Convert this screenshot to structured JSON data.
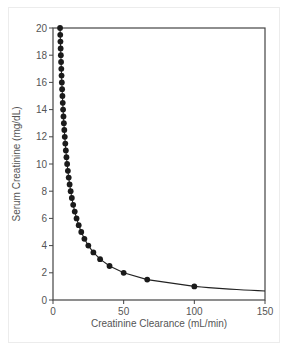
{
  "chart_data": {
    "type": "line",
    "title": "",
    "xlabel": "Creatinine Clearance (mL/min)",
    "ylabel": "Serum Creatinine (mg/dL)",
    "xlim": [
      0,
      150
    ],
    "ylim": [
      0,
      20
    ],
    "xticks": [
      0,
      50,
      100,
      150
    ],
    "yticks": [
      0,
      2,
      4,
      6,
      8,
      10,
      12,
      14,
      16,
      18,
      20
    ],
    "grid": false,
    "legend": null,
    "curve": "SCr = 100 / CrCl",
    "series": [
      {
        "name": "Serum Creatinine vs Creatinine Clearance",
        "markers": true,
        "points": [
          {
            "x": 5.0,
            "y": 20
          },
          {
            "x": 5.13,
            "y": 19.5
          },
          {
            "x": 5.26,
            "y": 19
          },
          {
            "x": 5.41,
            "y": 18.5
          },
          {
            "x": 5.56,
            "y": 18
          },
          {
            "x": 5.71,
            "y": 17.5
          },
          {
            "x": 5.88,
            "y": 17
          },
          {
            "x": 6.06,
            "y": 16.5
          },
          {
            "x": 6.25,
            "y": 16
          },
          {
            "x": 6.45,
            "y": 15.5
          },
          {
            "x": 6.67,
            "y": 15
          },
          {
            "x": 6.9,
            "y": 14.5
          },
          {
            "x": 7.14,
            "y": 14
          },
          {
            "x": 7.41,
            "y": 13.5
          },
          {
            "x": 7.69,
            "y": 13
          },
          {
            "x": 8.0,
            "y": 12.5
          },
          {
            "x": 8.33,
            "y": 12
          },
          {
            "x": 8.7,
            "y": 11.5
          },
          {
            "x": 9.09,
            "y": 11
          },
          {
            "x": 9.52,
            "y": 10.5
          },
          {
            "x": 10.0,
            "y": 10
          },
          {
            "x": 10.53,
            "y": 9.5
          },
          {
            "x": 11.11,
            "y": 9
          },
          {
            "x": 11.76,
            "y": 8.5
          },
          {
            "x": 12.5,
            "y": 8
          },
          {
            "x": 13.33,
            "y": 7.5
          },
          {
            "x": 14.29,
            "y": 7
          },
          {
            "x": 15.38,
            "y": 6.5
          },
          {
            "x": 16.67,
            "y": 6
          },
          {
            "x": 18.18,
            "y": 5.5
          },
          {
            "x": 20.0,
            "y": 5
          },
          {
            "x": 22.22,
            "y": 4.5
          },
          {
            "x": 25.0,
            "y": 4
          },
          {
            "x": 28.57,
            "y": 3.5
          },
          {
            "x": 33.33,
            "y": 3
          },
          {
            "x": 40.0,
            "y": 2.5
          },
          {
            "x": 50.0,
            "y": 2
          },
          {
            "x": 66.67,
            "y": 1.5
          },
          {
            "x": 100.0,
            "y": 1
          }
        ],
        "line_end": {
          "x": 150,
          "y": 0.67
        }
      }
    ]
  }
}
